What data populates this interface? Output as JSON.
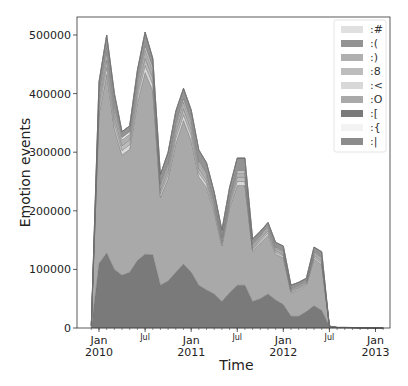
{
  "chart_data": {
    "type": "area",
    "stacked": true,
    "title": "",
    "xlabel": "Time",
    "ylabel": "Emotion events",
    "ylim": [
      0,
      530000
    ],
    "yticks": [
      0,
      100000,
      200000,
      300000,
      400000,
      500000
    ],
    "ytick_labels": [
      "0",
      "100000",
      "200000",
      "300000",
      "400000",
      "500000"
    ],
    "xticks": [
      {
        "month": 0,
        "label": "Jan",
        "sublabel": "2010",
        "major": true
      },
      {
        "month": 6,
        "label": "Jul",
        "sublabel": "",
        "major": false
      },
      {
        "month": 12,
        "label": "Jan",
        "sublabel": "2011",
        "major": true
      },
      {
        "month": 18,
        "label": "Jul",
        "sublabel": "",
        "major": false
      },
      {
        "month": 24,
        "label": "Jan",
        "sublabel": "2012",
        "major": true
      },
      {
        "month": 30,
        "label": "Jul",
        "sublabel": "",
        "major": false
      },
      {
        "month": 36,
        "label": "Jan",
        "sublabel": "2013",
        "major": true
      }
    ],
    "grid": false,
    "legend_position": "upper right",
    "x_months": [
      -1,
      0,
      1,
      2,
      3,
      4,
      5,
      6,
      7,
      8,
      9,
      10,
      11,
      12,
      13,
      14,
      15,
      16,
      17,
      18,
      19,
      20,
      21,
      22,
      23,
      24,
      25,
      26,
      27,
      28,
      29,
      30,
      31,
      32,
      33,
      34,
      35,
      36,
      37
    ],
    "total": [
      5000,
      420000,
      500000,
      400000,
      335000,
      345000,
      440000,
      505000,
      460000,
      262000,
      300000,
      370000,
      409000,
      372000,
      304000,
      282000,
      232000,
      167000,
      240000,
      290000,
      290000,
      152000,
      165000,
      180000,
      145000,
      140000,
      73000,
      78000,
      85000,
      138000,
      130000,
      3000,
      1000,
      1000,
      800,
      500,
      400
    ],
    "series": [
      {
        "name": ":[",
        "color": "#7a7a7a",
        "values": [
          0,
          110000,
          128000,
          100000,
          90000,
          95000,
          115000,
          126000,
          125000,
          73000,
          80000,
          95000,
          109000,
          95000,
          73000,
          65000,
          58000,
          45000,
          60000,
          73000,
          73000,
          45000,
          50000,
          58000,
          48000,
          40000,
          20000,
          20000,
          28000,
          38000,
          30000,
          3000,
          500,
          500,
          400,
          300,
          200
        ]
      },
      {
        "name": ":O",
        "color": "#a9a9a9",
        "values": [
          3000,
          255000,
          305000,
          240000,
          205000,
          210000,
          270000,
          310000,
          280000,
          150000,
          175000,
          220000,
          245000,
          225000,
          185000,
          175000,
          140000,
          95000,
          145000,
          170000,
          170000,
          85000,
          95000,
          100000,
          78000,
          80000,
          40000,
          45000,
          45000,
          80000,
          78000,
          0,
          300,
          300,
          200,
          100,
          100
        ]
      },
      {
        "name": ":<",
        "color": "#d8d8d8",
        "values": [
          500,
          10000,
          12000,
          9000,
          8000,
          8000,
          10000,
          12000,
          11000,
          6000,
          7000,
          9000,
          10000,
          9000,
          7000,
          6000,
          5000,
          4000,
          5000,
          7000,
          7000,
          3000,
          3500,
          4000,
          3000,
          3000,
          2000,
          2000,
          2000,
          3000,
          3000,
          0,
          0,
          0,
          0,
          0,
          0
        ]
      },
      {
        "name": ":8",
        "color": "#bdbdbd",
        "values": [
          500,
          10000,
          12000,
          10000,
          8000,
          8000,
          10000,
          12000,
          11000,
          6000,
          7000,
          9000,
          10000,
          9000,
          7000,
          6000,
          5000,
          4000,
          5000,
          7000,
          7000,
          3000,
          3500,
          4000,
          3000,
          3000,
          2000,
          2000,
          2000,
          3000,
          3000,
          0,
          0,
          0,
          0,
          0,
          0
        ]
      },
      {
        "name": ":)",
        "color": "#b0b0b0",
        "values": [
          500,
          12000,
          15000,
          12000,
          10000,
          10000,
          12000,
          15000,
          13000,
          8000,
          9000,
          11000,
          12000,
          11000,
          9000,
          8000,
          7000,
          5000,
          6000,
          8000,
          8000,
          4000,
          4000,
          5000,
          4000,
          4000,
          2000,
          2000,
          2000,
          4000,
          4000,
          0,
          0,
          0,
          0,
          0,
          0
        ]
      },
      {
        "name": ":{",
        "color": "#efefef",
        "values": [
          0,
          5000,
          6000,
          5000,
          4000,
          4000,
          5000,
          6000,
          5000,
          3000,
          3000,
          4000,
          5000,
          4000,
          3000,
          3000,
          2000,
          2000,
          2000,
          3000,
          3000,
          2000,
          1500,
          2000,
          1500,
          1500,
          1000,
          1000,
          1000,
          1500,
          1500,
          0,
          0,
          0,
          0,
          0,
          0
        ]
      },
      {
        "name": ":(",
        "color": "#939393",
        "values": [
          500,
          18000,
          22000,
          24000,
          10000,
          10000,
          18000,
          24000,
          15000,
          16000,
          19000,
          22000,
          18000,
          19000,
          20000,
          19000,
          15000,
          12000,
          17000,
          22000,
          22000,
          10000,
          7500,
          7000,
          8500,
          8500,
          6000,
          6000,
          5000,
          8500,
          10500,
          0,
          200,
          200,
          200,
          100,
          100
        ]
      },
      {
        "name": ":#",
        "color": "#e0e0e0",
        "values": [
          0,
          0,
          0,
          0,
          0,
          0,
          0,
          0,
          0,
          0,
          0,
          0,
          0,
          0,
          0,
          0,
          0,
          0,
          0,
          0,
          0,
          0,
          0,
          0,
          0,
          0,
          0,
          0,
          0,
          0,
          0,
          0,
          0,
          0,
          0,
          0,
          0
        ]
      },
      {
        "name": ":|",
        "color": "#8c8c8c",
        "values": [
          0,
          0,
          0,
          0,
          0,
          0,
          0,
          0,
          0,
          0,
          0,
          0,
          0,
          0,
          0,
          0,
          0,
          0,
          0,
          0,
          0,
          0,
          0,
          0,
          0,
          0,
          0,
          0,
          0,
          0,
          0,
          0,
          0,
          0,
          0,
          0,
          0
        ]
      }
    ],
    "legend": [
      {
        "label": ":#",
        "color": "#e0e0e0"
      },
      {
        "label": ":(",
        "color": "#939393"
      },
      {
        "label": ":)",
        "color": "#b0b0b0"
      },
      {
        "label": ":8",
        "color": "#bdbdbd"
      },
      {
        "label": ":<",
        "color": "#d8d8d8"
      },
      {
        "label": ":O",
        "color": "#a9a9a9"
      },
      {
        "label": ":[",
        "color": "#7a7a7a"
      },
      {
        "label": ":{",
        "color": "#f3f3f3"
      },
      {
        "label": ":|",
        "color": "#8c8c8c"
      }
    ]
  },
  "layout": {
    "plot_left": 77,
    "plot_right": 390,
    "plot_top": 17,
    "plot_bottom": 328,
    "x_origin_month0": 99,
    "px_per_month": 7.68,
    "px_per_unit": 0.000586
  }
}
